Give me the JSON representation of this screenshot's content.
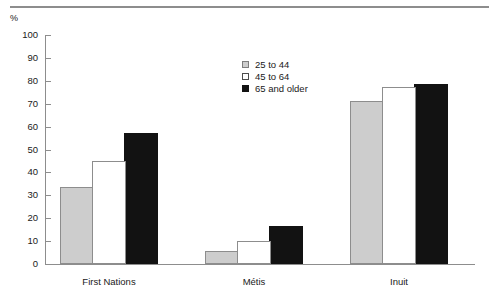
{
  "chart_data": {
    "type": "bar",
    "title": "",
    "subtitle": "",
    "xlabel": "",
    "ylabel": "%",
    "unit_label": "%",
    "ylim": [
      0,
      100
    ],
    "ytick_step": 10,
    "ytick_labels": [
      "100",
      "90",
      "80",
      "70",
      "60",
      "50",
      "40",
      "30",
      "20",
      "10",
      "0"
    ],
    "ytick_values": [
      100,
      90,
      80,
      70,
      60,
      50,
      40,
      30,
      20,
      10,
      0
    ],
    "grid": false,
    "legend_position": "upper-center",
    "categories": [
      "First Nations",
      "Métis",
      "Inuit"
    ],
    "series": [
      {
        "name": "25 to 44",
        "color": "#cdcdcd",
        "values": [
          33.5,
          5.5,
          71.0
        ]
      },
      {
        "name": "45 to 64",
        "color": "#ffffff",
        "values": [
          45.0,
          10.0,
          77.5
        ]
      },
      {
        "name": "65 and older",
        "color": "#121212",
        "values": [
          57.0,
          16.5,
          78.5
        ]
      }
    ],
    "annotations": []
  },
  "axis": {
    "y_ticks": [
      {
        "label": "100",
        "value": 100
      },
      {
        "label": "90",
        "value": 90
      },
      {
        "label": "80",
        "value": 80
      },
      {
        "label": "70",
        "value": 70
      },
      {
        "label": "60",
        "value": 60
      },
      {
        "label": "50",
        "value": 50
      },
      {
        "label": "40",
        "value": 40
      },
      {
        "label": "30",
        "value": 30
      },
      {
        "label": "20",
        "value": 20
      },
      {
        "label": "10",
        "value": 10
      },
      {
        "label": "0",
        "value": 0
      }
    ],
    "x_categories": [
      "First Nations",
      "Métis",
      "Inuit"
    ]
  },
  "legend": {
    "items": [
      {
        "label": "25 to 44",
        "swatch": "gray"
      },
      {
        "label": "45 to 64",
        "swatch": "white"
      },
      {
        "label": "65 and older",
        "swatch": "black"
      }
    ]
  },
  "colors": {
    "series_gray": "#cdcdcd",
    "series_white": "#ffffff",
    "series_black": "#121212",
    "axis": "#8d8d8d",
    "rule": "#8d8d8d",
    "text": "#1a1a1a",
    "background": "#ffffff"
  }
}
